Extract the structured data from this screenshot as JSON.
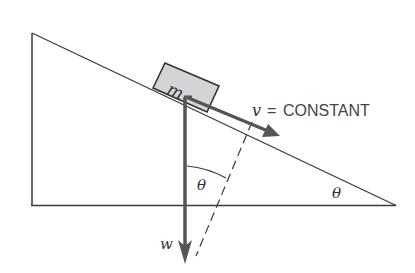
{
  "diagram": {
    "type": "physics-free-body",
    "block": {
      "label": "m"
    },
    "velocity": {
      "symbol": "v",
      "equals": "=",
      "value": "CONSTANT",
      "full_label": "v = CONSTANT"
    },
    "weight": {
      "label": "w"
    },
    "angles": {
      "force_angle_label": "θ",
      "incline_angle_label": "θ"
    },
    "colors": {
      "outline": "#3a3a3a",
      "arrow": "#555555",
      "block_fill": "#d4d4d4",
      "text": "#444444"
    }
  }
}
